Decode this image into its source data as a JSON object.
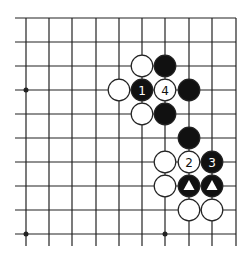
{
  "diagram": {
    "type": "go-board-fragment",
    "columns_x": [
      26,
      49,
      72,
      96,
      119,
      142,
      165,
      189,
      212,
      236
    ],
    "rows_y": [
      18,
      42,
      66,
      90,
      114,
      138,
      162,
      186,
      210,
      234
    ],
    "edges": {
      "top": true,
      "right": true,
      "left": false,
      "bottom": false
    },
    "star_points": [
      {
        "col": 0,
        "row": 3
      },
      {
        "col": 0,
        "row": 9
      },
      {
        "col": 6,
        "row": 9
      }
    ],
    "stones": [
      {
        "col": 5,
        "row": 2,
        "color": "white",
        "label": ""
      },
      {
        "col": 6,
        "row": 2,
        "color": "black",
        "label": ""
      },
      {
        "col": 4,
        "row": 3,
        "color": "white",
        "label": ""
      },
      {
        "col": 5,
        "row": 3,
        "color": "black",
        "label": "1"
      },
      {
        "col": 6,
        "row": 3,
        "color": "white",
        "label": "4"
      },
      {
        "col": 7,
        "row": 3,
        "color": "black",
        "label": ""
      },
      {
        "col": 5,
        "row": 4,
        "color": "white",
        "label": ""
      },
      {
        "col": 6,
        "row": 4,
        "color": "black",
        "label": ""
      },
      {
        "col": 7,
        "row": 5,
        "color": "black",
        "label": ""
      },
      {
        "col": 6,
        "row": 6,
        "color": "white",
        "label": ""
      },
      {
        "col": 7,
        "row": 6,
        "color": "white",
        "label": "2"
      },
      {
        "col": 8,
        "row": 6,
        "color": "black",
        "label": "3"
      },
      {
        "col": 6,
        "row": 7,
        "color": "white",
        "label": ""
      },
      {
        "col": 7,
        "row": 7,
        "color": "black",
        "label": "",
        "mark": "triangle"
      },
      {
        "col": 8,
        "row": 7,
        "color": "black",
        "label": "",
        "mark": "triangle"
      },
      {
        "col": 7,
        "row": 8,
        "color": "white",
        "label": ""
      },
      {
        "col": 8,
        "row": 8,
        "color": "white",
        "label": ""
      }
    ],
    "colors": {
      "line": "#222222",
      "black_stone": "#111111",
      "white_stone": "#ffffff",
      "stone_outline": "#222222"
    }
  }
}
